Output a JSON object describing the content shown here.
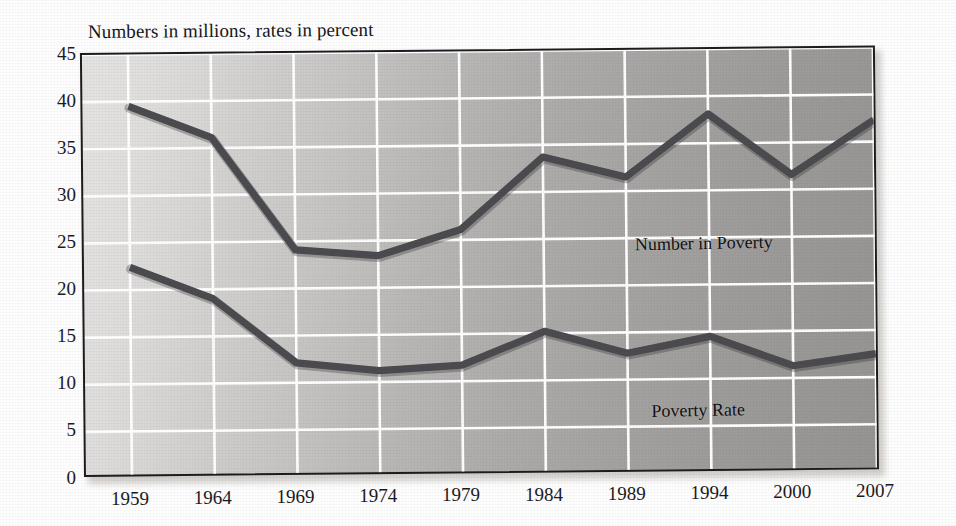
{
  "chart_data": {
    "type": "line",
    "title": "Numbers in millions, rates in percent",
    "xlabel": "",
    "ylabel": "",
    "ylim": [
      0,
      45
    ],
    "yticks": [
      0,
      5,
      10,
      15,
      20,
      25,
      30,
      35,
      40,
      45
    ],
    "ytick_labels": [
      "0",
      "5",
      "10",
      "15",
      "20",
      "25",
      "30",
      "35",
      "40",
      "45"
    ],
    "categories": [
      "1959",
      "1964",
      "1969",
      "1974",
      "1979",
      "1984",
      "1989",
      "1994",
      "2000",
      "2007"
    ],
    "x": [
      1959,
      1964,
      1969,
      1974,
      1979,
      1984,
      1989,
      1994,
      2000,
      2007
    ],
    "grid": true,
    "legend_position": "in-plot annotations",
    "series": [
      {
        "name": "Number in Poverty",
        "units": "millions",
        "color": "#4c4b50",
        "values": [
          39.5,
          36.1,
          24.1,
          23.4,
          26.1,
          33.7,
          31.5,
          38.1,
          31.6,
          37.3
        ]
      },
      {
        "name": "Poverty Rate",
        "units": "percent",
        "color": "#4c4b50",
        "values": [
          22.4,
          19.0,
          12.1,
          11.2,
          11.7,
          15.2,
          12.8,
          14.5,
          11.3,
          12.5
        ]
      }
    ],
    "annotations": [
      {
        "text": "Number in Poverty",
        "series": "Number in Poverty"
      },
      {
        "text": "Poverty Rate",
        "series": "Poverty Rate"
      }
    ]
  },
  "colors": {
    "line": "#4c4b50",
    "gridline": "#ffffff",
    "frame": "#1d1c1f",
    "text": "#1b1a1d",
    "plot_background_light": "#e5e4e2",
    "plot_background_dark": "#979593"
  }
}
